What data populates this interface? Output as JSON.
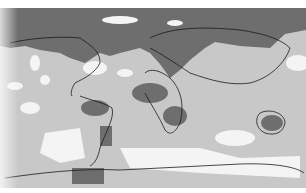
{
  "map": {
    "type": "world-map",
    "projection": "equirectangular",
    "style": "grayscale-shaded",
    "shading_levels": [
      {
        "name": "dark",
        "color": "#6e6e6e"
      },
      {
        "name": "light",
        "color": "#c8c8c8"
      },
      {
        "name": "white",
        "color": "#f4f4f4"
      }
    ],
    "coastline_color": "#1a1a1a"
  }
}
